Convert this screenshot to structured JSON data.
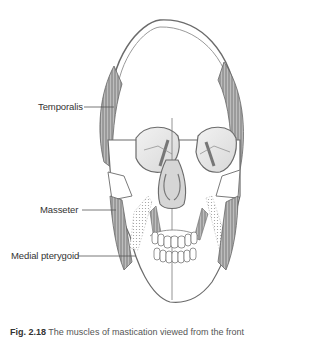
{
  "figure": {
    "labels": {
      "temporalis": "Temporalis",
      "masseter": "Masseter",
      "medial_pterygoid": "Medial pterygoid"
    },
    "caption": {
      "number": "Fig. 2.18",
      "text": "The muscles of mastication viewed from the front"
    }
  },
  "colors": {
    "line": "#6b6b6b",
    "muscle": "#9a9a9a",
    "muscle_dark": "#666666",
    "bone_fill": "#ffffff",
    "orbit_fill": "#e6e6e6"
  }
}
